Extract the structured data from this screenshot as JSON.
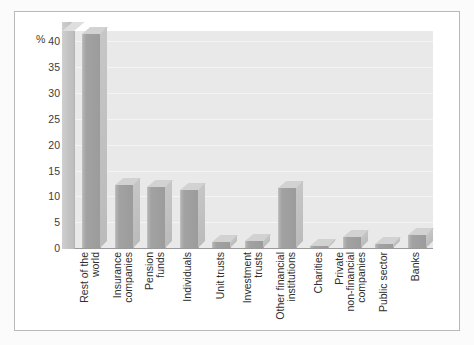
{
  "chart_data": {
    "type": "bar",
    "title": "",
    "subtitle": "",
    "xlabel": "",
    "ylabel": "%",
    "unit_label": "%",
    "ylim": [
      0,
      42
    ],
    "ytick_labels": [
      "40",
      "35",
      "30",
      "25",
      "20",
      "15",
      "10",
      "5",
      "0"
    ],
    "ytick_values": [
      40,
      35,
      30,
      25,
      20,
      15,
      10,
      5,
      0
    ],
    "grid": true,
    "legend": "none",
    "orientation": "vertical",
    "style": "3d-bar",
    "categories": [
      "Rest of the world",
      "Insurance companies",
      "Pension funds",
      "Individuals",
      "Unit trusts",
      "Investment trusts",
      "Other financial institutions",
      "Charities",
      "Private non-financial companies",
      "Public sector",
      "Banks"
    ],
    "category_lines": [
      [
        "Rest of the",
        "world"
      ],
      [
        "Insurance",
        "companies"
      ],
      [
        "Pension",
        "funds"
      ],
      [
        "Individuals"
      ],
      [
        "Unit trusts"
      ],
      [
        "Investment",
        "trusts"
      ],
      [
        "Other financial",
        "institutions"
      ],
      [
        "Charities"
      ],
      [
        "Private",
        "non-financial",
        "companies"
      ],
      [
        "Public sector"
      ],
      [
        "Banks"
      ]
    ],
    "values": [
      41.5,
      12.2,
      11.8,
      11.2,
      1.1,
      1.3,
      11.7,
      0.4,
      2.2,
      0.8,
      2.6
    ],
    "colors": {
      "bar_face": "#9b9b9b",
      "bar_top": "#d2d2d2",
      "bar_side": "#c0c0c0",
      "plot_background": "#e9e9e9",
      "gridline": "#f4f4f4",
      "axis": "#9a9a9a",
      "text": "#2e2e2e",
      "frame": "#b9b9b9",
      "page_background": "#fbfbfb"
    }
  }
}
